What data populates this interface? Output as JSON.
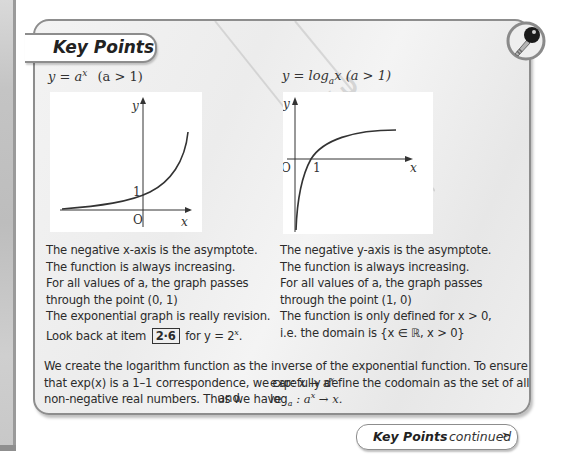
{
  "panel": {
    "title": "Key Points",
    "icon": "key-icon",
    "continued": {
      "bold": "Key Points",
      "label": "continued",
      "arrow": "➣"
    }
  },
  "left_column": {
    "equation": "y = a",
    "equation_sup": "x",
    "equation_condition": "(a > 1)",
    "graph": {
      "type": "exponential",
      "y_label": "y",
      "x_label": "x",
      "origin_label": "O",
      "intercept_label": "1"
    },
    "lines": [
      "The negative x-axis is the asymptote.",
      "The function is always increasing.",
      "For all values of a, the graph passes",
      "through the point (0, 1)",
      "The exponential graph is really revision."
    ],
    "lookback_prefix": "Look back at item",
    "lookback_item": "2·6",
    "lookback_suffix": "for y = 2",
    "lookback_sup": "x",
    "lookback_end": "."
  },
  "right_column": {
    "equation": "y = log",
    "equation_sub": "a",
    "equation_rest": "x (a > 1)",
    "graph": {
      "type": "logarithm",
      "y_label": "y",
      "x_label": "x",
      "origin_label": "O",
      "intercept_label": "1"
    },
    "lines": [
      "The negative y-axis is the asymptote.",
      "The function is always increasing.",
      "For all values of a, the graph passes",
      "through the point (1, 0)",
      "The function is only defined for x > 0,",
      "i.e. the domain is {x ∈ ℝ, x > 0}"
    ]
  },
  "paragraph": {
    "lines": [
      "We create the logarithm function as the inverse of the exponential function. To ensure",
      "that exp(x) is a 1–1 correspondence, we carefully define the codomain as the set of all",
      "non-negative real numbers.  Thus we have"
    ],
    "map1": "exp: x → a",
    "map1_sup": "x",
    "and_label": "and",
    "map2_prefix": "log",
    "map2_sub": "a",
    "map2_mid": " : a",
    "map2_sup": "x",
    "map2_end": " → x."
  }
}
